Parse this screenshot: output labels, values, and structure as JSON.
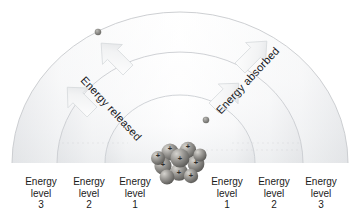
{
  "diagram": {
    "center": {
      "x": 180,
      "y": 163
    },
    "baseline_y": 163,
    "colors": {
      "background": "#ffffff",
      "shell_light": "#ffffff",
      "shell_shade": "#e2e4e6",
      "shell_edge": "#c9ccd0",
      "arrow_fill": "#f7f8f9",
      "arrow_shade": "#d8dbde",
      "nucleus_base": "#8e8d8a",
      "nucleus_light": "#cfcdc8",
      "nucleus_dark": "#5b5a57",
      "electron": "#7d7c79",
      "text": "#1b1b1b"
    },
    "shells": [
      {
        "name": "level-1",
        "radius": 75
      },
      {
        "name": "level-2",
        "radius": 123
      },
      {
        "name": "level-3",
        "radius": 168
      }
    ],
    "nucleus": {
      "name": "nucleus",
      "radius": 25,
      "charge_symbol": "+",
      "proton_count_visible": 8
    },
    "electrons": [
      {
        "name": "electron-outer-left",
        "x": 98,
        "y": 32
      },
      {
        "name": "electron-inner-right",
        "x": 206,
        "y": 120
      }
    ],
    "arrows": {
      "released": {
        "label": "Energy released",
        "direction": "inward",
        "count": 2
      },
      "absorbed": {
        "label": "Energy absorbed",
        "direction": "outward",
        "count": 2
      }
    },
    "labels": {
      "left": [
        {
          "name": "energy-level-3-left",
          "line1": "Energy",
          "line2": "level",
          "line3": "3",
          "x": 14
        },
        {
          "name": "energy-level-2-left",
          "line1": "Energy",
          "line2": "level",
          "line3": "2",
          "x": 62
        },
        {
          "name": "energy-level-1-left",
          "line1": "Energy",
          "line2": "level",
          "line3": "1",
          "x": 108
        }
      ],
      "right": [
        {
          "name": "energy-level-1-right",
          "line1": "Energy",
          "line2": "level",
          "line3": "1",
          "x": 200
        },
        {
          "name": "energy-level-2-right",
          "line1": "Energy",
          "line2": "level",
          "line3": "2",
          "x": 247
        },
        {
          "name": "energy-level-3-right",
          "line1": "Energy",
          "line2": "level",
          "line3": "3",
          "x": 294
        }
      ]
    }
  }
}
